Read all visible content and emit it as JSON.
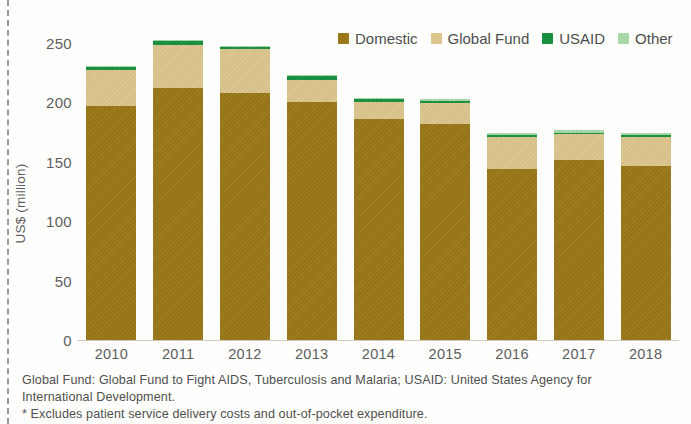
{
  "chart_data": {
    "type": "bar",
    "stacked": true,
    "title": "",
    "xlabel": "",
    "ylabel": "US$ (million)",
    "ylim": [
      0,
      250
    ],
    "yticks": [
      0,
      50,
      100,
      150,
      200,
      250
    ],
    "grid": false,
    "legend_position": "top-right",
    "categories": [
      "2010",
      "2011",
      "2012",
      "2013",
      "2014",
      "2015",
      "2016",
      "2017",
      "2018"
    ],
    "series": [
      {
        "name": "Domestic",
        "color": "#9a7718",
        "values": [
          189,
          203,
          199,
          192,
          178,
          174,
          138,
          145,
          140
        ]
      },
      {
        "name": "Global Fund",
        "color": "#dcc68d",
        "values": [
          29,
          35,
          36,
          18,
          14,
          17,
          26,
          21,
          24
        ]
      },
      {
        "name": "USAID",
        "color": "#17913f",
        "values": [
          2,
          3,
          1,
          3,
          2,
          2,
          1,
          1,
          1
        ]
      },
      {
        "name": "Other",
        "color": "#a8d8a8",
        "values": [
          1,
          1,
          1,
          1,
          1,
          1,
          2,
          2,
          2
        ]
      }
    ],
    "totals": [
      221,
      242,
      237,
      214,
      195,
      194,
      167,
      169,
      167
    ]
  },
  "axis": {
    "y_title": "US$ (million)",
    "y_ticks": [
      "250",
      "200",
      "150",
      "100",
      "50",
      "0"
    ],
    "x_ticks": [
      "2010",
      "2011",
      "2012",
      "2013",
      "2014",
      "2015",
      "2016",
      "2017",
      "2018"
    ]
  },
  "legend": {
    "items": [
      {
        "label": "Domestic",
        "color": "#9a7718"
      },
      {
        "label": "Global Fund",
        "color": "#dcc68d"
      },
      {
        "label": "USAID",
        "color": "#17913f"
      },
      {
        "label": "Other",
        "color": "#a8d8a8"
      }
    ]
  },
  "notes": {
    "line1": "Global Fund: Global Fund to Fight AIDS, Tuberculosis and Malaria; USAID: United States Agency for",
    "line2": "International Development.",
    "line3": "* Excludes patient service delivery costs and out-of-pocket expenditure."
  }
}
